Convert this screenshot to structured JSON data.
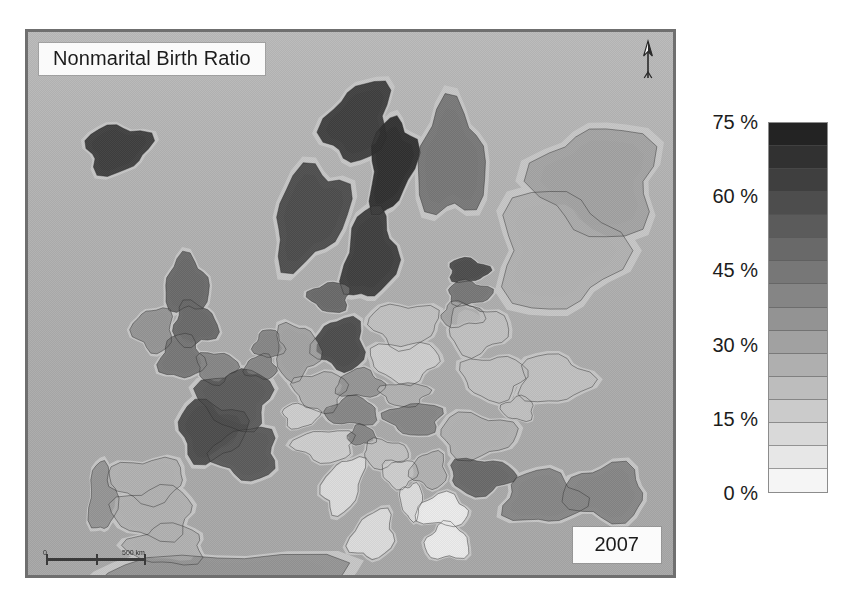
{
  "map": {
    "title": "Nonmarital Birth Ratio",
    "year": "2007",
    "north_label": "N",
    "scale": {
      "min_label": "0",
      "max_label": "500 km"
    },
    "frame_color": "#6f6f6f",
    "ocean_color": "#b0b0b0"
  },
  "legend": {
    "unit": "%",
    "title": "",
    "labels": [
      {
        "text": "75 %",
        "value": 75
      },
      {
        "text": "60 %",
        "value": 60
      },
      {
        "text": "45 %",
        "value": 45
      },
      {
        "text": "30 %",
        "value": 30
      },
      {
        "text": "15 %",
        "value": 15
      },
      {
        "text": "0 %",
        "value": 0
      }
    ],
    "range_min": 0,
    "range_max": 75,
    "band_count": 16,
    "low_color": "#ffffff",
    "high_color": "#1f1f1f"
  },
  "chart_data": {
    "type": "heatmap",
    "title": "Nonmarital Birth Ratio",
    "subtitle": "2007",
    "xlabel": "",
    "ylabel": "",
    "legend_position": "right",
    "grid": false,
    "colorbar": {
      "unit": "%",
      "ticks": [
        0,
        15,
        30,
        45,
        60,
        75
      ],
      "tick_labels": [
        "0 %",
        "15 %",
        "30 %",
        "45 %",
        "60 %",
        "75 %"
      ],
      "vmin": 0,
      "vmax": 75,
      "n_bands": 16,
      "colormap": "greys_reversed"
    },
    "regions": [
      {
        "name": "Iceland",
        "value": 64,
        "x": 115,
        "y": 147,
        "rx": 32,
        "ry": 24,
        "rot": -12
      },
      {
        "name": "Norway (north)",
        "value": 62,
        "x": 358,
        "y": 120,
        "rx": 30,
        "ry": 42,
        "rot": 28
      },
      {
        "name": "Norway (south)",
        "value": 60,
        "x": 310,
        "y": 215,
        "rx": 34,
        "ry": 52,
        "rot": 22
      },
      {
        "name": "Sweden (north)",
        "value": 66,
        "x": 392,
        "y": 163,
        "rx": 22,
        "ry": 48,
        "rot": 10
      },
      {
        "name": "Sweden (south)",
        "value": 61,
        "x": 370,
        "y": 255,
        "rx": 26,
        "ry": 46,
        "rot": 8
      },
      {
        "name": "Finland",
        "value": 45,
        "x": 452,
        "y": 160,
        "rx": 34,
        "ry": 56,
        "rot": 0
      },
      {
        "name": "Denmark",
        "value": 48,
        "x": 330,
        "y": 297,
        "rx": 20,
        "ry": 15,
        "rot": 0
      },
      {
        "name": "Estonia",
        "value": 59,
        "x": 469,
        "y": 270,
        "rx": 20,
        "ry": 12,
        "rot": 0
      },
      {
        "name": "Latvia",
        "value": 43,
        "x": 470,
        "y": 293,
        "rx": 22,
        "ry": 12,
        "rot": 0
      },
      {
        "name": "Lithuania",
        "value": 29,
        "x": 463,
        "y": 315,
        "rx": 22,
        "ry": 12,
        "rot": 0
      },
      {
        "name": "Scotland",
        "value": 50,
        "x": 185,
        "y": 285,
        "rx": 22,
        "ry": 28,
        "rot": 0
      },
      {
        "name": "Northern England",
        "value": 48,
        "x": 193,
        "y": 325,
        "rx": 22,
        "ry": 22,
        "rot": 0
      },
      {
        "name": "Ireland",
        "value": 33,
        "x": 152,
        "y": 330,
        "rx": 20,
        "ry": 22,
        "rot": 0
      },
      {
        "name": "Wales / SW England",
        "value": 46,
        "x": 180,
        "y": 358,
        "rx": 22,
        "ry": 22,
        "rot": 0
      },
      {
        "name": "SE England",
        "value": 42,
        "x": 215,
        "y": 368,
        "rx": 20,
        "ry": 16,
        "rot": 0
      },
      {
        "name": "Netherlands",
        "value": 38,
        "x": 268,
        "y": 345,
        "rx": 15,
        "ry": 14,
        "rot": 0
      },
      {
        "name": "Belgium",
        "value": 39,
        "x": 260,
        "y": 368,
        "rx": 16,
        "ry": 12,
        "rot": 0
      },
      {
        "name": "Germany (east)",
        "value": 57,
        "x": 340,
        "y": 345,
        "rx": 26,
        "ry": 26,
        "rot": 0
      },
      {
        "name": "Germany (west)",
        "value": 29,
        "x": 296,
        "y": 352,
        "rx": 22,
        "ry": 28,
        "rot": 0
      },
      {
        "name": "Germany (south)",
        "value": 25,
        "x": 320,
        "y": 392,
        "rx": 26,
        "ry": 20,
        "rot": 0
      },
      {
        "name": "Poland (north)",
        "value": 22,
        "x": 405,
        "y": 325,
        "rx": 34,
        "ry": 22,
        "rot": 0
      },
      {
        "name": "Poland (south)",
        "value": 18,
        "x": 405,
        "y": 362,
        "rx": 34,
        "ry": 20,
        "rot": 0
      },
      {
        "name": "Belarus",
        "value": 22,
        "x": 478,
        "y": 330,
        "rx": 30,
        "ry": 24,
        "rot": 0
      },
      {
        "name": "Ukraine (west)",
        "value": 21,
        "x": 495,
        "y": 378,
        "rx": 32,
        "ry": 22,
        "rot": 0
      },
      {
        "name": "Ukraine (east)",
        "value": 22,
        "x": 555,
        "y": 380,
        "rx": 36,
        "ry": 24,
        "rot": 0
      },
      {
        "name": "Russia (northwest)",
        "value": 26,
        "x": 560,
        "y": 250,
        "rx": 60,
        "ry": 60,
        "rot": 0
      },
      {
        "name": "Russia (central)",
        "value": 29,
        "x": 600,
        "y": 180,
        "rx": 60,
        "ry": 55,
        "rot": 0
      },
      {
        "name": "Czechia",
        "value": 35,
        "x": 360,
        "y": 385,
        "rx": 24,
        "ry": 14,
        "rot": 0
      },
      {
        "name": "Slovakia",
        "value": 28,
        "x": 405,
        "y": 395,
        "rx": 24,
        "ry": 12,
        "rot": 0
      },
      {
        "name": "Austria",
        "value": 38,
        "x": 352,
        "y": 413,
        "rx": 26,
        "ry": 14,
        "rot": 0
      },
      {
        "name": "Hungary",
        "value": 38,
        "x": 415,
        "y": 420,
        "rx": 28,
        "ry": 16,
        "rot": 0
      },
      {
        "name": "Switzerland",
        "value": 17,
        "x": 300,
        "y": 417,
        "rx": 18,
        "ry": 12,
        "rot": 0
      },
      {
        "name": "France (north)",
        "value": 55,
        "x": 235,
        "y": 400,
        "rx": 36,
        "ry": 30,
        "rot": 0
      },
      {
        "name": "France (west)",
        "value": 57,
        "x": 210,
        "y": 432,
        "rx": 34,
        "ry": 30,
        "rot": 0
      },
      {
        "name": "France (south)",
        "value": 52,
        "x": 245,
        "y": 455,
        "rx": 32,
        "ry": 26,
        "rot": 0
      },
      {
        "name": "Portugal",
        "value": 34,
        "x": 100,
        "y": 500,
        "rx": 14,
        "ry": 34,
        "rot": 0
      },
      {
        "name": "Spain (north)",
        "value": 26,
        "x": 145,
        "y": 482,
        "rx": 38,
        "ry": 22,
        "rot": 0
      },
      {
        "name": "Spain (central)",
        "value": 24,
        "x": 152,
        "y": 515,
        "rx": 40,
        "ry": 26,
        "rot": 0
      },
      {
        "name": "Spain (south)",
        "value": 28,
        "x": 165,
        "y": 548,
        "rx": 38,
        "ry": 20,
        "rot": 0
      },
      {
        "name": "Italy (north)",
        "value": 17,
        "x": 325,
        "y": 447,
        "rx": 30,
        "ry": 16,
        "rot": 0
      },
      {
        "name": "Italy (central)",
        "value": 14,
        "x": 343,
        "y": 487,
        "rx": 18,
        "ry": 30,
        "rot": 25
      },
      {
        "name": "Italy (south)",
        "value": 12,
        "x": 373,
        "y": 538,
        "rx": 20,
        "ry": 26,
        "rot": 35
      },
      {
        "name": "Slovenia",
        "value": 40,
        "x": 362,
        "y": 437,
        "rx": 14,
        "ry": 10,
        "rot": 0
      },
      {
        "name": "Croatia",
        "value": 22,
        "x": 385,
        "y": 455,
        "rx": 22,
        "ry": 14,
        "rot": 0
      },
      {
        "name": "Bosnia",
        "value": 18,
        "x": 400,
        "y": 475,
        "rx": 18,
        "ry": 14,
        "rot": 0
      },
      {
        "name": "Serbia",
        "value": 24,
        "x": 430,
        "y": 472,
        "rx": 18,
        "ry": 18,
        "rot": 0
      },
      {
        "name": "Romania",
        "value": 28,
        "x": 478,
        "y": 437,
        "rx": 38,
        "ry": 22,
        "rot": 0
      },
      {
        "name": "Bulgaria",
        "value": 51,
        "x": 482,
        "y": 478,
        "rx": 32,
        "ry": 18,
        "rot": 0
      },
      {
        "name": "Moldova",
        "value": 22,
        "x": 520,
        "y": 410,
        "rx": 16,
        "ry": 12,
        "rot": 0
      },
      {
        "name": "Albania",
        "value": 12,
        "x": 412,
        "y": 503,
        "rx": 11,
        "ry": 18,
        "rot": 0
      },
      {
        "name": "Greece (north)",
        "value": 7,
        "x": 443,
        "y": 513,
        "rx": 26,
        "ry": 16,
        "rot": 0
      },
      {
        "name": "Greece (south)",
        "value": 6,
        "x": 448,
        "y": 545,
        "rx": 22,
        "ry": 18,
        "rot": 0
      },
      {
        "name": "Turkey (west)",
        "value": 42,
        "x": 545,
        "y": 500,
        "rx": 40,
        "ry": 26,
        "rot": 0
      },
      {
        "name": "Turkey (east)",
        "value": 40,
        "x": 608,
        "y": 495,
        "rx": 40,
        "ry": 28,
        "rot": 0
      },
      {
        "name": "North Africa",
        "value": 35,
        "x": 230,
        "y": 585,
        "rx": 120,
        "ry": 30,
        "rot": 0
      }
    ]
  }
}
